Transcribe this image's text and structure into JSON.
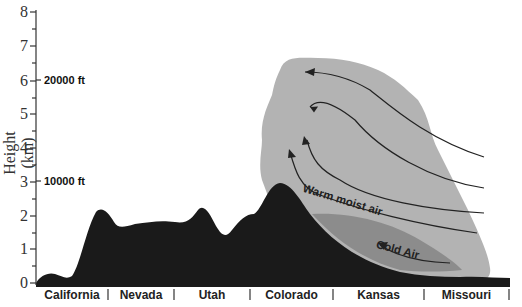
{
  "diagram": {
    "type": "cross-section",
    "y_axis": {
      "label": "Height (km)",
      "ticks": [
        "0",
        "1",
        "2",
        "3",
        "4",
        "5",
        "6",
        "7",
        "8"
      ],
      "range": [
        0,
        8
      ]
    },
    "altitude_markers": [
      {
        "label": "20000 ft",
        "height_km": 6.1
      },
      {
        "label": "10000 ft",
        "height_km": 3.05
      }
    ],
    "regions": [
      "California",
      "Nevada",
      "Utah",
      "Colorado",
      "Kansas",
      "Missouri"
    ],
    "annotations": {
      "warm_air": "Warm moist air",
      "cold_air": "Cold Air"
    },
    "colors": {
      "terrain": "#1a1a1a",
      "cloud": "#b3b3b3",
      "cold_air": "#8c8c8c",
      "arrows": "#222222",
      "axis": "#333333"
    }
  }
}
